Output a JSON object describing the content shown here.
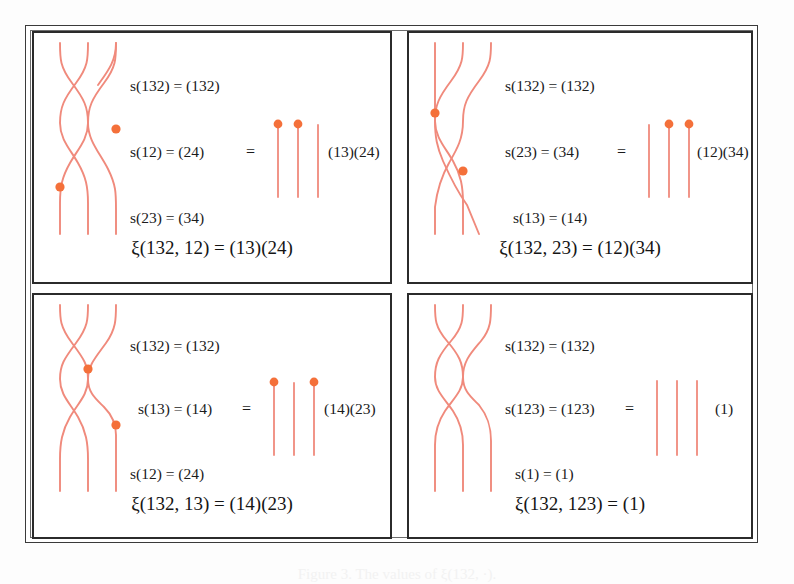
{
  "figure": {
    "caption": "Figure 3. The values of ξ(132, ·).",
    "strand_color": "#f08a7c",
    "dot_color": "#f4703a",
    "frame_color": "#2b2b2b",
    "text_color": "#1b1b1b"
  },
  "panels": [
    {
      "id": "panel-1",
      "lines": [
        {
          "lhs": "s(132)",
          "rhs": "(132)",
          "text": "s(132) = (132)"
        },
        {
          "lhs": "s(12)",
          "rhs": "(24)",
          "text": "s(12) = (24)"
        },
        {
          "lhs": "s(23)",
          "rhs": "(34)",
          "text": "s(23) = (34)"
        }
      ],
      "equals": "=",
      "result_cycle": "(13)(24)",
      "result_dots": [
        true,
        true,
        false
      ],
      "caption": "ξ(132, 12) = (13)(24)"
    },
    {
      "id": "panel-2",
      "lines": [
        {
          "lhs": "s(132)",
          "rhs": "(132)",
          "text": "s(132) = (132)"
        },
        {
          "lhs": "s(23)",
          "rhs": "(34)",
          "text": "s(23) = (34)"
        },
        {
          "lhs": "s(13)",
          "rhs": "(14)",
          "text": "s(13) = (14)"
        }
      ],
      "equals": "=",
      "result_cycle": "(12)(34)",
      "result_dots": [
        false,
        true,
        true
      ],
      "caption": "ξ(132, 23) = (12)(34)"
    },
    {
      "id": "panel-3",
      "lines": [
        {
          "lhs": "s(132)",
          "rhs": "(132)",
          "text": "s(132) = (132)"
        },
        {
          "lhs": "s(13)",
          "rhs": "(14)",
          "text": "s(13) = (14)"
        },
        {
          "lhs": "s(12)",
          "rhs": "(24)",
          "text": "s(12) = (24)"
        }
      ],
      "equals": "=",
      "result_cycle": "(14)(23)",
      "result_dots": [
        true,
        false,
        true
      ],
      "caption": "ξ(132, 13) = (14)(23)"
    },
    {
      "id": "panel-4",
      "lines": [
        {
          "lhs": "s(132)",
          "rhs": "(132)",
          "text": "s(132) = (132)"
        },
        {
          "lhs": "s(123)",
          "rhs": "(123)",
          "text": "s(123) = (123)"
        },
        {
          "lhs": "s(1)",
          "rhs": "(1)",
          "text": "s(1) = (1)"
        }
      ],
      "equals": "=",
      "result_cycle": "(1)",
      "result_dots": [
        false,
        false,
        false
      ],
      "caption": "ξ(132, 123) = (1)"
    }
  ]
}
